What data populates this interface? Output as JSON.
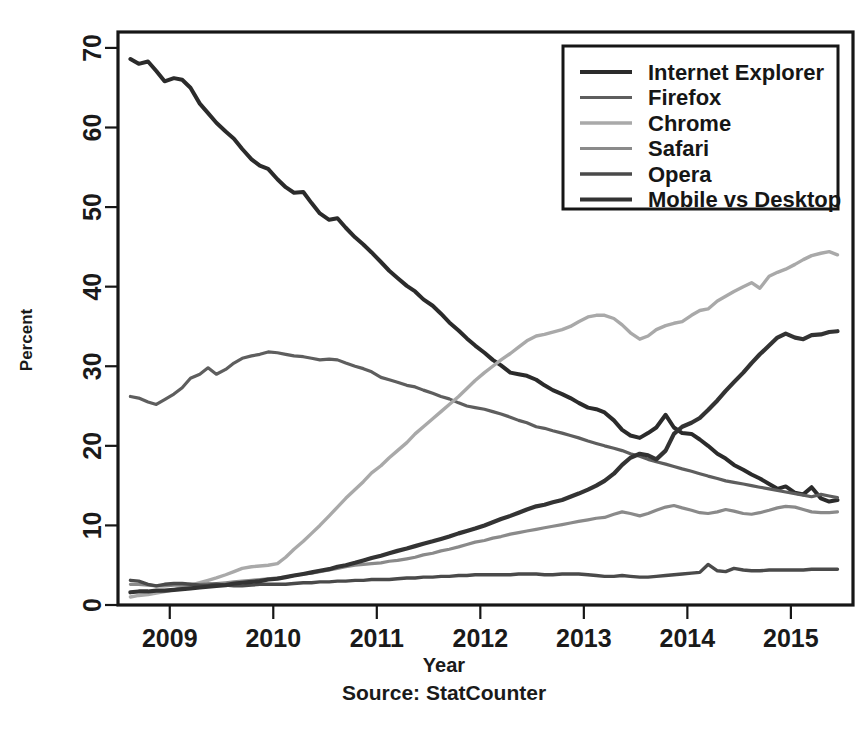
{
  "chart_data": {
    "type": "line",
    "title": "",
    "xlabel": "Year",
    "ylabel": "Percent",
    "source": "Source: StatCounter",
    "xlim": [
      2008.5,
      2015.6
    ],
    "ylim": [
      0,
      72
    ],
    "xticks": [
      "2009",
      "2010",
      "2011",
      "2012",
      "2013",
      "2014",
      "2015"
    ],
    "xtick_values": [
      2009,
      2010,
      2011,
      2012,
      2013,
      2014,
      2015
    ],
    "yticks": [
      "0",
      "10",
      "20",
      "30",
      "40",
      "50",
      "60",
      "70"
    ],
    "ytick_values": [
      0,
      10,
      20,
      30,
      40,
      50,
      60,
      70
    ],
    "grid": false,
    "legend_position": "top-right",
    "series": [
      {
        "name": "Internet Explorer",
        "color": "#2b2b2b",
        "width": 4.0,
        "x": [
          2008.62,
          2008.7,
          2008.79,
          2008.87,
          2008.95,
          2009.04,
          2009.12,
          2009.2,
          2009.29,
          2009.37,
          2009.45,
          2009.54,
          2009.62,
          2009.7,
          2009.79,
          2009.87,
          2009.95,
          2010.04,
          2010.12,
          2010.2,
          2010.29,
          2010.37,
          2010.45,
          2010.54,
          2010.62,
          2010.7,
          2010.79,
          2010.87,
          2010.95,
          2011.04,
          2011.12,
          2011.2,
          2011.29,
          2011.37,
          2011.45,
          2011.54,
          2011.62,
          2011.7,
          2011.79,
          2011.87,
          2011.95,
          2012.04,
          2012.12,
          2012.2,
          2012.29,
          2012.37,
          2012.45,
          2012.54,
          2012.62,
          2012.7,
          2012.79,
          2012.87,
          2012.95,
          2013.04,
          2013.12,
          2013.2,
          2013.29,
          2013.37,
          2013.45,
          2013.54,
          2013.62,
          2013.7,
          2013.79,
          2013.87,
          2013.95,
          2014.04,
          2014.12,
          2014.2,
          2014.29,
          2014.37,
          2014.45,
          2014.54,
          2014.62,
          2014.7,
          2014.79,
          2014.87,
          2014.95,
          2015.04,
          2015.12,
          2015.2,
          2015.29,
          2015.37,
          2015.45
        ],
        "y": [
          68.6,
          68.0,
          68.3,
          67.1,
          65.8,
          66.2,
          66.0,
          65.0,
          63.0,
          61.8,
          60.6,
          59.5,
          58.6,
          57.3,
          56.0,
          55.2,
          54.8,
          53.5,
          52.5,
          51.8,
          51.9,
          50.5,
          49.2,
          48.4,
          48.6,
          47.4,
          46.2,
          45.3,
          44.3,
          43.1,
          42.0,
          41.1,
          40.1,
          39.4,
          38.4,
          37.6,
          36.6,
          35.5,
          34.5,
          33.5,
          32.6,
          31.7,
          30.8,
          30.1,
          29.2,
          29.0,
          28.8,
          28.3,
          27.6,
          27.0,
          26.5,
          26.0,
          25.4,
          24.8,
          24.6,
          24.2,
          23.2,
          22.0,
          21.3,
          21.0,
          21.6,
          22.3,
          23.9,
          22.3,
          21.6,
          21.5,
          20.8,
          20.0,
          19.0,
          18.4,
          17.6,
          17.0,
          16.4,
          15.9,
          15.2,
          14.6,
          14.9,
          14.1,
          13.9,
          14.8,
          13.4,
          13.0,
          13.2
        ]
      },
      {
        "name": "Firefox",
        "color": "#5e5e5e",
        "width": 3.2,
        "x": [
          2008.62,
          2008.7,
          2008.79,
          2008.87,
          2008.95,
          2009.04,
          2009.12,
          2009.2,
          2009.29,
          2009.37,
          2009.45,
          2009.54,
          2009.62,
          2009.7,
          2009.79,
          2009.87,
          2009.95,
          2010.04,
          2010.12,
          2010.2,
          2010.29,
          2010.37,
          2010.45,
          2010.54,
          2010.62,
          2010.7,
          2010.79,
          2010.87,
          2010.95,
          2011.04,
          2011.12,
          2011.2,
          2011.29,
          2011.37,
          2011.45,
          2011.54,
          2011.62,
          2011.7,
          2011.79,
          2011.87,
          2011.95,
          2012.04,
          2012.12,
          2012.2,
          2012.29,
          2012.37,
          2012.45,
          2012.54,
          2012.62,
          2012.7,
          2012.79,
          2012.87,
          2012.95,
          2013.04,
          2013.12,
          2013.2,
          2013.29,
          2013.37,
          2013.45,
          2013.54,
          2013.62,
          2013.7,
          2013.79,
          2013.87,
          2013.95,
          2014.04,
          2014.12,
          2014.2,
          2014.29,
          2014.37,
          2014.45,
          2014.54,
          2014.62,
          2014.7,
          2014.79,
          2014.87,
          2014.95,
          2015.04,
          2015.12,
          2015.2,
          2015.29,
          2015.37,
          2015.45
        ],
        "y": [
          26.2,
          26.0,
          25.5,
          25.2,
          25.8,
          26.5,
          27.3,
          28.5,
          29.0,
          29.8,
          29.0,
          29.6,
          30.4,
          31.0,
          31.3,
          31.5,
          31.8,
          31.7,
          31.5,
          31.3,
          31.2,
          31.0,
          30.8,
          30.9,
          30.8,
          30.4,
          30.0,
          29.7,
          29.3,
          28.6,
          28.3,
          28.0,
          27.6,
          27.4,
          27.0,
          26.6,
          26.2,
          25.9,
          25.4,
          25.0,
          24.8,
          24.6,
          24.3,
          24.0,
          23.6,
          23.2,
          22.9,
          22.4,
          22.2,
          21.9,
          21.6,
          21.3,
          21.0,
          20.6,
          20.3,
          20.0,
          19.7,
          19.4,
          19.0,
          18.7,
          18.3,
          18.0,
          17.7,
          17.4,
          17.1,
          16.8,
          16.5,
          16.2,
          15.9,
          15.6,
          15.4,
          15.2,
          15.0,
          14.8,
          14.6,
          14.4,
          14.2,
          14.0,
          13.8,
          13.6,
          13.9,
          13.7,
          13.5
        ]
      },
      {
        "name": "Chrome",
        "color": "#a9a9a9",
        "width": 3.4,
        "x": [
          2008.62,
          2008.7,
          2008.79,
          2008.87,
          2008.95,
          2009.04,
          2009.12,
          2009.2,
          2009.29,
          2009.37,
          2009.45,
          2009.54,
          2009.62,
          2009.7,
          2009.79,
          2009.87,
          2009.95,
          2010.04,
          2010.12,
          2010.2,
          2010.29,
          2010.37,
          2010.45,
          2010.54,
          2010.62,
          2010.7,
          2010.79,
          2010.87,
          2010.95,
          2011.04,
          2011.12,
          2011.2,
          2011.29,
          2011.37,
          2011.45,
          2011.54,
          2011.62,
          2011.7,
          2011.79,
          2011.87,
          2011.95,
          2012.04,
          2012.12,
          2012.2,
          2012.29,
          2012.37,
          2012.45,
          2012.54,
          2012.62,
          2012.7,
          2012.79,
          2012.87,
          2012.95,
          2013.04,
          2013.12,
          2013.2,
          2013.29,
          2013.37,
          2013.45,
          2013.54,
          2013.62,
          2013.7,
          2013.79,
          2013.87,
          2013.95,
          2014.04,
          2014.12,
          2014.2,
          2014.29,
          2014.37,
          2014.45,
          2014.54,
          2014.62,
          2014.7,
          2014.79,
          2014.87,
          2014.95,
          2015.04,
          2015.12,
          2015.2,
          2015.29,
          2015.37,
          2015.45
        ],
        "y": [
          1.0,
          1.2,
          1.3,
          1.5,
          1.7,
          1.9,
          2.2,
          2.5,
          2.8,
          3.1,
          3.4,
          3.8,
          4.2,
          4.6,
          4.8,
          4.9,
          5.0,
          5.2,
          6.0,
          7.0,
          8.0,
          9.0,
          10.0,
          11.2,
          12.3,
          13.4,
          14.5,
          15.5,
          16.6,
          17.5,
          18.5,
          19.4,
          20.4,
          21.5,
          22.4,
          23.4,
          24.3,
          25.2,
          26.2,
          27.2,
          28.2,
          29.2,
          30.0,
          30.8,
          31.6,
          32.4,
          33.2,
          33.8,
          34.0,
          34.3,
          34.6,
          35.0,
          35.6,
          36.2,
          36.4,
          36.4,
          36.0,
          35.2,
          34.2,
          33.4,
          33.8,
          34.6,
          35.1,
          35.4,
          35.6,
          36.4,
          37.0,
          37.2,
          38.2,
          38.8,
          39.4,
          40.0,
          40.5,
          39.8,
          41.3,
          41.8,
          42.2,
          42.8,
          43.4,
          43.9,
          44.2,
          44.4,
          44.0
        ]
      },
      {
        "name": "Safari",
        "color": "#8a8a8a",
        "width": 3.2,
        "x": [
          2008.62,
          2008.7,
          2008.79,
          2008.87,
          2008.95,
          2009.04,
          2009.12,
          2009.2,
          2009.29,
          2009.37,
          2009.45,
          2009.54,
          2009.62,
          2009.7,
          2009.79,
          2009.87,
          2009.95,
          2010.04,
          2010.12,
          2010.2,
          2010.29,
          2010.37,
          2010.45,
          2010.54,
          2010.62,
          2010.7,
          2010.79,
          2010.87,
          2010.95,
          2011.04,
          2011.12,
          2011.2,
          2011.29,
          2011.37,
          2011.45,
          2011.54,
          2011.62,
          2011.7,
          2011.79,
          2011.87,
          2011.95,
          2012.04,
          2012.12,
          2012.2,
          2012.29,
          2012.37,
          2012.45,
          2012.54,
          2012.62,
          2012.7,
          2012.79,
          2012.87,
          2012.95,
          2013.04,
          2013.12,
          2013.2,
          2013.29,
          2013.37,
          2013.45,
          2013.54,
          2013.62,
          2013.7,
          2013.79,
          2013.87,
          2013.95,
          2014.04,
          2014.12,
          2014.2,
          2014.29,
          2014.37,
          2014.45,
          2014.54,
          2014.62,
          2014.7,
          2014.79,
          2014.87,
          2014.95,
          2015.04,
          2015.12,
          2015.2,
          2015.29,
          2015.37,
          2015.45
        ],
        "y": [
          2.6,
          2.6,
          2.5,
          2.4,
          2.4,
          2.5,
          2.5,
          2.6,
          2.6,
          2.7,
          2.7,
          2.8,
          2.9,
          3.0,
          3.1,
          3.2,
          3.3,
          3.4,
          3.5,
          3.7,
          3.9,
          4.0,
          4.2,
          4.4,
          4.6,
          4.8,
          5.0,
          5.1,
          5.2,
          5.3,
          5.5,
          5.6,
          5.8,
          6.0,
          6.3,
          6.5,
          6.8,
          7.0,
          7.3,
          7.6,
          7.9,
          8.1,
          8.4,
          8.6,
          8.9,
          9.1,
          9.3,
          9.5,
          9.7,
          9.9,
          10.1,
          10.3,
          10.5,
          10.7,
          10.9,
          11.0,
          11.4,
          11.7,
          11.5,
          11.2,
          11.5,
          11.9,
          12.3,
          12.5,
          12.2,
          11.9,
          11.6,
          11.5,
          11.7,
          12.0,
          11.8,
          11.5,
          11.4,
          11.6,
          11.9,
          12.2,
          12.4,
          12.3,
          12.0,
          11.7,
          11.6,
          11.6,
          11.7
        ]
      },
      {
        "name": "Opera",
        "color": "#4a4a4a",
        "width": 3.4,
        "x": [
          2008.62,
          2008.7,
          2008.79,
          2008.87,
          2008.95,
          2009.04,
          2009.12,
          2009.2,
          2009.29,
          2009.37,
          2009.45,
          2009.54,
          2009.62,
          2009.7,
          2009.79,
          2009.87,
          2009.95,
          2010.04,
          2010.12,
          2010.2,
          2010.29,
          2010.37,
          2010.45,
          2010.54,
          2010.62,
          2010.7,
          2010.79,
          2010.87,
          2010.95,
          2011.04,
          2011.12,
          2011.2,
          2011.29,
          2011.37,
          2011.45,
          2011.54,
          2011.62,
          2011.7,
          2011.79,
          2011.87,
          2011.95,
          2012.04,
          2012.12,
          2012.2,
          2012.29,
          2012.37,
          2012.45,
          2012.54,
          2012.62,
          2012.7,
          2012.79,
          2012.87,
          2012.95,
          2013.04,
          2013.12,
          2013.2,
          2013.29,
          2013.37,
          2013.45,
          2013.54,
          2013.62,
          2013.7,
          2013.79,
          2013.87,
          2013.95,
          2014.04,
          2014.12,
          2014.2,
          2014.29,
          2014.37,
          2014.45,
          2014.54,
          2014.62,
          2014.7,
          2014.79,
          2014.87,
          2014.95,
          2015.04,
          2015.12,
          2015.2,
          2015.29,
          2015.37,
          2015.45
        ],
        "y": [
          3.1,
          3.0,
          2.6,
          2.4,
          2.6,
          2.7,
          2.7,
          2.6,
          2.5,
          2.5,
          2.6,
          2.5,
          2.4,
          2.4,
          2.5,
          2.6,
          2.6,
          2.6,
          2.6,
          2.7,
          2.8,
          2.8,
          2.9,
          2.9,
          3.0,
          3.0,
          3.1,
          3.1,
          3.2,
          3.2,
          3.2,
          3.3,
          3.4,
          3.4,
          3.5,
          3.5,
          3.6,
          3.6,
          3.7,
          3.7,
          3.8,
          3.8,
          3.8,
          3.8,
          3.8,
          3.9,
          3.9,
          3.9,
          3.8,
          3.8,
          3.9,
          3.9,
          3.9,
          3.8,
          3.7,
          3.6,
          3.6,
          3.7,
          3.6,
          3.5,
          3.5,
          3.6,
          3.7,
          3.8,
          3.9,
          4.0,
          4.1,
          5.1,
          4.3,
          4.2,
          4.6,
          4.4,
          4.3,
          4.3,
          4.4,
          4.4,
          4.4,
          4.4,
          4.4,
          4.5,
          4.5,
          4.5,
          4.5
        ]
      },
      {
        "name": "Mobile vs Desktop",
        "color": "#333333",
        "width": 4.2,
        "x": [
          2008.62,
          2008.7,
          2008.79,
          2008.87,
          2008.95,
          2009.04,
          2009.12,
          2009.2,
          2009.29,
          2009.37,
          2009.45,
          2009.54,
          2009.62,
          2009.7,
          2009.79,
          2009.87,
          2009.95,
          2010.04,
          2010.12,
          2010.2,
          2010.29,
          2010.37,
          2010.45,
          2010.54,
          2010.62,
          2010.7,
          2010.79,
          2010.87,
          2010.95,
          2011.04,
          2011.12,
          2011.2,
          2011.29,
          2011.37,
          2011.45,
          2011.54,
          2011.62,
          2011.7,
          2011.79,
          2011.87,
          2011.95,
          2012.04,
          2012.12,
          2012.2,
          2012.29,
          2012.37,
          2012.45,
          2012.54,
          2012.62,
          2012.7,
          2012.79,
          2012.87,
          2012.95,
          2013.04,
          2013.12,
          2013.2,
          2013.29,
          2013.37,
          2013.45,
          2013.54,
          2013.62,
          2013.7,
          2013.79,
          2013.87,
          2013.95,
          2014.04,
          2014.12,
          2014.2,
          2014.29,
          2014.37,
          2014.45,
          2014.54,
          2014.62,
          2014.7,
          2014.79,
          2014.87,
          2014.95,
          2015.04,
          2015.12,
          2015.2,
          2015.29,
          2015.37,
          2015.45
        ],
        "y": [
          1.6,
          1.7,
          1.7,
          1.8,
          1.8,
          1.9,
          2.0,
          2.1,
          2.2,
          2.3,
          2.4,
          2.5,
          2.7,
          2.8,
          2.9,
          3.0,
          3.2,
          3.3,
          3.5,
          3.7,
          3.9,
          4.1,
          4.3,
          4.5,
          4.8,
          5.0,
          5.3,
          5.6,
          5.9,
          6.2,
          6.5,
          6.8,
          7.1,
          7.4,
          7.7,
          8.0,
          8.3,
          8.6,
          9.0,
          9.3,
          9.6,
          10.0,
          10.4,
          10.8,
          11.2,
          11.6,
          12.0,
          12.4,
          12.6,
          12.9,
          13.2,
          13.6,
          14.0,
          14.5,
          15.0,
          15.6,
          16.5,
          17.6,
          18.5,
          19.0,
          18.8,
          18.3,
          19.4,
          21.5,
          22.4,
          22.9,
          23.5,
          24.5,
          25.7,
          26.9,
          28.0,
          29.2,
          30.4,
          31.5,
          32.6,
          33.6,
          34.1,
          33.6,
          33.4,
          33.9,
          34.0,
          34.3,
          34.4
        ]
      }
    ]
  },
  "legend": {
    "entries": [
      {
        "label": "Internet Explorer"
      },
      {
        "label": "Firefox"
      },
      {
        "label": "Chrome"
      },
      {
        "label": "Safari"
      },
      {
        "label": "Opera"
      },
      {
        "label": "Mobile vs Desktop"
      }
    ]
  },
  "axes": {
    "x_title": "Year",
    "y_title": "Percent",
    "source_caption": "Source: StatCounter"
  }
}
